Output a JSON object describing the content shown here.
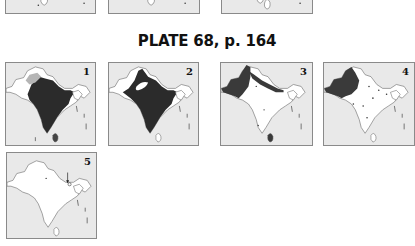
{
  "plate": {
    "title": "PLATE 68, p. 164"
  },
  "top_row_partial": [
    {
      "id": "prev-a"
    },
    {
      "id": "prev-b"
    },
    {
      "id": "prev-c"
    }
  ],
  "maps": [
    {
      "number": "1",
      "shading": "nearly entire subcontinent dark; light grey in northwest Kashmir",
      "dark_color": "#2b2b2b"
    },
    {
      "number": "2",
      "shading": "nearly entire subcontinent dark with white gap in northwest",
      "dark_color": "#2b2b2b"
    },
    {
      "number": "3",
      "shading": "northwest (Pakistan) and Himalayan belt dark; Sri Lanka dark",
      "dark_color": "#3a3a3a"
    },
    {
      "number": "4",
      "shading": "northwest (Pakistan) and Punjab region dark; scattered dots",
      "dark_color": "#3a3a3a"
    },
    {
      "number": "5",
      "shading": "outline only with arrow pointing to northeast location",
      "dark_color": "#3a3a3a"
    }
  ],
  "colors": {
    "sea": "#e9e9e9",
    "land": "#ffffff",
    "border": "#8a8a8a",
    "dark": "#2e2e2e"
  }
}
